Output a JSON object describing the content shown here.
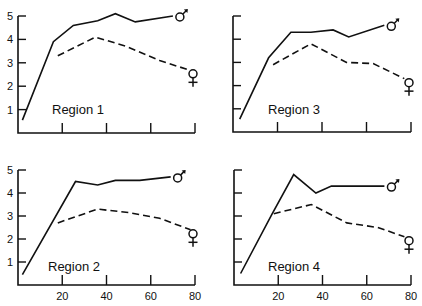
{
  "chart_data": [
    {
      "type": "line",
      "title": "Region 1",
      "xlabel": "",
      "ylabel": "",
      "xlim": [
        0,
        80
      ],
      "ylim": [
        0,
        5
      ],
      "xticks": [
        20,
        40,
        60,
        80
      ],
      "xtick_labels": [],
      "yticks": [
        1,
        2,
        3,
        4,
        5
      ],
      "ytick_labels": [
        "1",
        "2",
        "3",
        "4",
        "5"
      ],
      "grid": false,
      "series": [
        {
          "name": "male",
          "symbol": "♂",
          "style": "solid",
          "x": [
            2,
            16,
            25,
            36,
            44,
            53,
            70
          ],
          "y": [
            0.55,
            3.9,
            4.6,
            4.8,
            5.1,
            4.75,
            5.0
          ]
        },
        {
          "name": "female",
          "symbol": "♀",
          "style": "dashed",
          "x": [
            18,
            35,
            49,
            64,
            77
          ],
          "y": [
            3.3,
            4.1,
            3.7,
            3.1,
            2.7
          ]
        }
      ]
    },
    {
      "type": "line",
      "title": "Region 3",
      "xlabel": "",
      "ylabel": "",
      "xlim": [
        0,
        80
      ],
      "ylim": [
        0,
        5
      ],
      "xticks": [
        20,
        40,
        60,
        80
      ],
      "xtick_labels": [],
      "yticks": [
        1,
        2,
        3,
        4,
        5
      ],
      "ytick_labels": [],
      "grid": false,
      "series": [
        {
          "name": "male",
          "symbol": "♂",
          "style": "solid",
          "x": [
            3,
            16,
            26,
            35,
            45,
            52,
            68
          ],
          "y": [
            0.55,
            3.2,
            4.3,
            4.3,
            4.4,
            4.1,
            4.6
          ]
        },
        {
          "name": "female",
          "symbol": "♀",
          "style": "dashed",
          "x": [
            18,
            35,
            51,
            63,
            77
          ],
          "y": [
            2.9,
            3.8,
            3.0,
            2.95,
            2.3
          ]
        }
      ]
    },
    {
      "type": "line",
      "title": "Region 2",
      "xlabel": "",
      "ylabel": "",
      "xlim": [
        0,
        80
      ],
      "ylim": [
        0,
        5
      ],
      "xticks": [
        20,
        40,
        60,
        80
      ],
      "xtick_labels": [
        "20",
        "40",
        "60",
        "80"
      ],
      "yticks": [
        1,
        2,
        3,
        4,
        5
      ],
      "ytick_labels": [
        "1",
        "2",
        "3",
        "4",
        "5"
      ],
      "grid": false,
      "series": [
        {
          "name": "male",
          "symbol": "♂",
          "style": "solid",
          "x": [
            2,
            26,
            36,
            44,
            55,
            69
          ],
          "y": [
            0.45,
            4.5,
            4.35,
            4.55,
            4.55,
            4.7
          ]
        },
        {
          "name": "female",
          "symbol": "♀",
          "style": "dashed",
          "x": [
            18,
            36,
            50,
            64,
            78
          ],
          "y": [
            2.7,
            3.3,
            3.15,
            2.9,
            2.4
          ]
        }
      ]
    },
    {
      "type": "line",
      "title": "Region 4",
      "xlabel": "",
      "ylabel": "",
      "xlim": [
        0,
        80
      ],
      "ylim": [
        0,
        5
      ],
      "xticks": [
        20,
        40,
        60,
        80
      ],
      "xtick_labels": [
        "20",
        "40",
        "60",
        "80"
      ],
      "yticks": [
        1,
        2,
        3,
        4,
        5
      ],
      "ytick_labels": [],
      "grid": false,
      "series": [
        {
          "name": "male",
          "symbol": "♂",
          "style": "solid",
          "x": [
            3,
            17,
            27,
            37,
            44,
            68
          ],
          "y": [
            0.5,
            3.05,
            4.8,
            4.0,
            4.3,
            4.3
          ]
        },
        {
          "name": "female",
          "symbol": "♀",
          "style": "dashed",
          "x": [
            18,
            35,
            51,
            65,
            77
          ],
          "y": [
            3.1,
            3.5,
            2.7,
            2.5,
            2.1
          ]
        }
      ]
    }
  ],
  "panels": [
    {
      "label": "Region 1"
    },
    {
      "label": "Region 3"
    },
    {
      "label": "Region 2"
    },
    {
      "label": "Region 4"
    }
  ],
  "legend": {
    "male_symbol": "♂",
    "female_symbol": "♀"
  },
  "colors": {
    "ink": "#111111",
    "background": "#ffffff"
  }
}
